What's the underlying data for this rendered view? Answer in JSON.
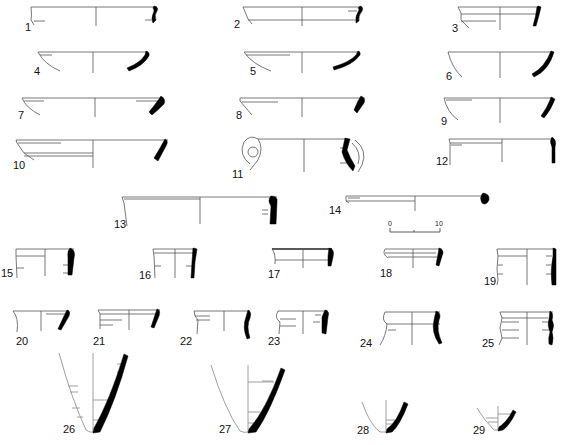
{
  "plate": {
    "figures": [
      {
        "id": "1",
        "label": "1",
        "type": "bowl-rim"
      },
      {
        "id": "2",
        "label": "2",
        "type": "bowl-rim"
      },
      {
        "id": "3",
        "label": "3",
        "type": "bowl-rim"
      },
      {
        "id": "4",
        "label": "4",
        "type": "bowl-rim"
      },
      {
        "id": "5",
        "label": "5",
        "type": "bowl-rim"
      },
      {
        "id": "6",
        "label": "6",
        "type": "bowl-rim"
      },
      {
        "id": "7",
        "label": "7",
        "type": "bowl-rim"
      },
      {
        "id": "8",
        "label": "8",
        "type": "bowl-rim"
      },
      {
        "id": "9",
        "label": "9",
        "type": "bowl-rim"
      },
      {
        "id": "10",
        "label": "10",
        "type": "bowl-rim"
      },
      {
        "id": "11",
        "label": "11",
        "type": "handled-rim"
      },
      {
        "id": "12",
        "label": "12",
        "type": "rim"
      },
      {
        "id": "13",
        "label": "13",
        "type": "large-rim"
      },
      {
        "id": "14",
        "label": "14",
        "type": "plate-rim"
      },
      {
        "id": "15",
        "label": "15",
        "type": "jar-rim"
      },
      {
        "id": "16",
        "label": "16",
        "type": "jar-rim"
      },
      {
        "id": "17",
        "label": "17",
        "type": "jar-rim"
      },
      {
        "id": "18",
        "label": "18",
        "type": "jar-rim"
      },
      {
        "id": "19",
        "label": "19",
        "type": "jar-rim"
      },
      {
        "id": "20",
        "label": "20",
        "type": "jar-rim"
      },
      {
        "id": "21",
        "label": "21",
        "type": "jar-rim"
      },
      {
        "id": "22",
        "label": "22",
        "type": "jar-rim"
      },
      {
        "id": "23",
        "label": "23",
        "type": "jar-rim"
      },
      {
        "id": "24",
        "label": "24",
        "type": "jar-rim"
      },
      {
        "id": "25",
        "label": "25",
        "type": "jar-rim"
      },
      {
        "id": "26",
        "label": "26",
        "type": "toe-base"
      },
      {
        "id": "27",
        "label": "27",
        "type": "toe-base"
      },
      {
        "id": "28",
        "label": "28",
        "type": "toe-base"
      },
      {
        "id": "29",
        "label": "29",
        "type": "toe-base"
      }
    ],
    "scale_bar": {
      "start_label": "0",
      "end_label": "10"
    },
    "colors": {
      "ink": "#000000",
      "line": "#555555",
      "background": "#ffffff"
    }
  }
}
